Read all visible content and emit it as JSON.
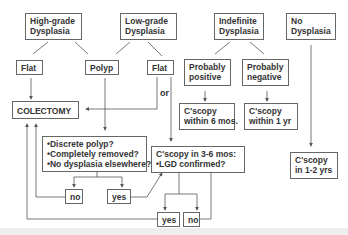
{
  "diagram": {
    "nodes": {
      "high_grade": "High-grade\nDysplasia",
      "low_grade": "Low-grade\nDysplasia",
      "indefinite": "Indefinite\nDysplasia",
      "no_dysplasia": "No\nDysplasia",
      "hg_flat": "Flat",
      "polyp": "Polyp",
      "lg_flat": "Flat",
      "prob_positive": "Probably\npositive",
      "prob_negative": "Probably\nnegative",
      "colectomy": "COLECTOMY",
      "cscopy_6mos": "C'scopy\nwithin 6 mos.",
      "cscopy_1yr": "C'scopy\nwithin 1 yr",
      "polyp_questions": "•Discrete polyp?\n•Completely removed?\n•No dysplasia elsewhere?",
      "cscopy_3_6": "C'scopy in 3-6 mos:\n•LGD confirmed?",
      "cscopy_1_2": "C'scopy\nin 1-2 yrs",
      "polyp_no": "no",
      "polyp_yes": "yes",
      "lgd_yes": "yes",
      "lgd_no": "no"
    },
    "labels": {
      "or": "or"
    },
    "colors": {
      "line": "#555555",
      "border": "#666666",
      "text": "#333333"
    }
  }
}
